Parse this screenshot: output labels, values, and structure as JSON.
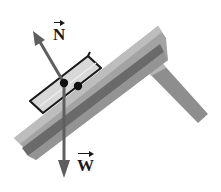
{
  "diagram": {
    "labels": {
      "normal_force": "N",
      "weight": "W"
    },
    "colors": {
      "ramp_light": "#a9a9a9",
      "ramp_dark": "#6f6f6f",
      "ramp_stripe": "#5a5a5a",
      "block_fill": "#d6d6d6",
      "block_edge": "#1a1a1a",
      "arrow": "#5e5e5e",
      "point": "#111111"
    },
    "vectors": [
      {
        "name": "N",
        "direction": "perpendicular to incline, up-left"
      },
      {
        "name": "W",
        "direction": "vertically downward"
      }
    ]
  }
}
